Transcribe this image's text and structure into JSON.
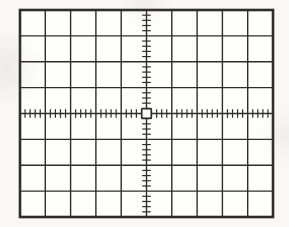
{
  "figure": {
    "graticule": {
      "horizontal_divisions": 10,
      "vertical_divisions": 8,
      "minor_ticks_per_division": 5,
      "tick_axes": [
        "center-horizontal",
        "center-vertical"
      ],
      "center_marker": "open-square",
      "trace": "none"
    },
    "colors": {
      "line": "#2e2d2b",
      "screen_background": "#fefefc",
      "page_background": "#f9f8f5"
    }
  }
}
